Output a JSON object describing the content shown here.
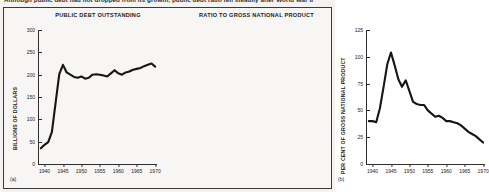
{
  "figure": {
    "caption_partial": "Although public debt had not dropped from its growth, public debt ratio fell steadily after World War II"
  },
  "panels": [
    {
      "letter": "(a)",
      "title": "PUBLIC DEBT OUTSTANDING",
      "ylabel": "BILLIONS OF DOLLARS"
    },
    {
      "letter": "(b)",
      "title": "RATIO TO GROSS NATIONAL PRODUCT",
      "ylabel": "PER CENT OF GROSS NATIONAL PRODUCT"
    }
  ],
  "chart_data": [
    {
      "type": "line",
      "title": "PUBLIC DEBT OUTSTANDING",
      "xlabel": "",
      "ylabel": "BILLIONS OF DOLLARS",
      "xlim": [
        1938.5,
        1970.5
      ],
      "ylim": [
        0,
        300
      ],
      "yticks": [
        0,
        50,
        100,
        150,
        200,
        250,
        300
      ],
      "xticks": [
        1940,
        1945,
        1950,
        1955,
        1960,
        1965,
        1970
      ],
      "grid": false,
      "legend": "none",
      "x": [
        1939,
        1940,
        1941,
        1942,
        1943,
        1944,
        1945,
        1946,
        1947,
        1948,
        1949,
        1950,
        1951,
        1952,
        1953,
        1954,
        1955,
        1956,
        1957,
        1958,
        1959,
        1960,
        1961,
        1962,
        1963,
        1964,
        1965,
        1966,
        1967,
        1968,
        1969,
        1970
      ],
      "values": [
        35,
        43,
        49,
        72,
        137,
        201,
        222,
        205,
        200,
        195,
        193,
        196,
        191,
        193,
        200,
        201,
        200,
        198,
        196,
        203,
        210,
        203,
        200,
        205,
        207,
        211,
        213,
        215,
        219,
        222,
        225,
        218
      ]
    },
    {
      "type": "line",
      "title": "RATIO TO GROSS NATIONAL PRODUCT",
      "xlabel": "",
      "ylabel": "PER CENT OF GROSS NATIONAL PRODUCT",
      "xlim": [
        1938.5,
        1970.5
      ],
      "ylim": [
        0,
        125
      ],
      "yticks": [
        0,
        25,
        50,
        75,
        100,
        125
      ],
      "xticks": [
        1940,
        1945,
        1950,
        1955,
        1960,
        1965,
        1970
      ],
      "grid": false,
      "legend": "none",
      "x": [
        1939,
        1940,
        1941,
        1942,
        1943,
        1944,
        1945,
        1946,
        1947,
        1948,
        1949,
        1950,
        1951,
        1952,
        1953,
        1954,
        1955,
        1956,
        1957,
        1958,
        1959,
        1960,
        1961,
        1962,
        1963,
        1964,
        1965,
        1966,
        1967,
        1968,
        1969,
        1970
      ],
      "values": [
        40,
        40,
        39,
        52,
        72,
        93,
        104,
        92,
        79,
        72,
        78,
        68,
        58,
        56,
        55,
        55,
        50,
        47,
        44,
        45,
        43,
        40,
        40,
        39,
        38,
        36,
        33,
        30,
        28,
        26,
        23,
        20
      ]
    }
  ]
}
